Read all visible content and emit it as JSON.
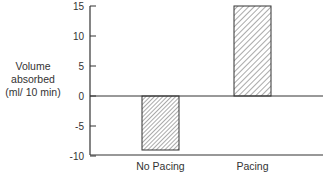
{
  "chart_data": {
    "type": "bar",
    "title": "",
    "xlabel": "",
    "ylabel": "Volume absorbed (ml/ 10 min)",
    "ylabel_lines": [
      "Volume",
      "absorbed",
      "(ml/ 10 min)"
    ],
    "categories": [
      "No Pacing",
      "Pacing"
    ],
    "values": [
      -9,
      15
    ],
    "ylim": [
      -10,
      15
    ],
    "yticks": [
      15,
      10,
      5,
      0,
      -5,
      -10
    ],
    "grid": false,
    "legend": null,
    "bar_fill": "diagonal hatch",
    "colors": {
      "axis": "#333333",
      "hatch": "#444444",
      "background": "#ffffff"
    }
  }
}
